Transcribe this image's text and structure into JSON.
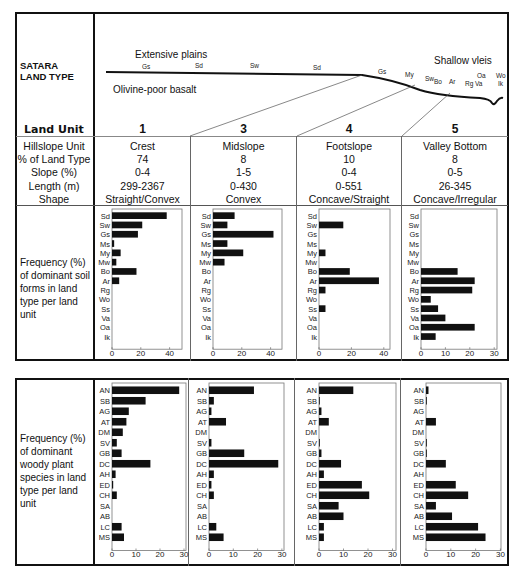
{
  "header": {
    "land_type_label": "SATARA LAND TYPE",
    "profile": {
      "extensive_plains": "Extensive plains",
      "shallow_vleis": "Shallow vleis",
      "geology": "Olivine-poor basalt",
      "soil_tags": [
        "Gs",
        "Sd",
        "Sw",
        "Sd",
        "Gs",
        "My",
        "Sw",
        "Bo",
        "Ar",
        "Rg",
        "Va",
        "Oa",
        "Wo",
        "Ik"
      ]
    }
  },
  "table": {
    "land_unit_label": "Land Unit",
    "units": [
      "1",
      "3",
      "4",
      "5"
    ],
    "rows": [
      {
        "label": "Hillslope Unit",
        "values": [
          "Crest",
          "Midslope",
          "Footslope",
          "Valley Bottom"
        ]
      },
      {
        "label": "% of Land Type",
        "values": [
          "74",
          "8",
          "10",
          "8"
        ]
      },
      {
        "label": "Slope (%)",
        "values": [
          "0-4",
          "1-5",
          "0-4",
          "0-5"
        ]
      },
      {
        "label": "Length (m)",
        "values": [
          "299-2367",
          "0-430",
          "0-551",
          "26-345"
        ]
      },
      {
        "label": "Shape",
        "values": [
          "Straight/Convex",
          "Convex",
          "Concave/Straight",
          "Concave/Irregular"
        ]
      }
    ],
    "soil_section_label": "Frequency (%) of dominant soil forms in land type per land unit",
    "woody_section_label": "Frequency (%) of dominant woody plant species in land type per land unit"
  },
  "chart_data": [
    {
      "type": "bar",
      "orientation": "horizontal",
      "title": "Soil forms - Land unit 1 (Crest)",
      "categories": [
        "Sd",
        "Sw",
        "Gs",
        "Ms",
        "My",
        "Mw",
        "Bo",
        "Ar",
        "Rg",
        "Wo",
        "Ss",
        "Va",
        "Oa",
        "Ik"
      ],
      "values": [
        38,
        21,
        18,
        1.5,
        6,
        3,
        17,
        5,
        0,
        0,
        0,
        0,
        0,
        0
      ],
      "xlim": [
        0,
        50
      ],
      "xticks": [
        0,
        20,
        40
      ]
    },
    {
      "type": "bar",
      "orientation": "horizontal",
      "title": "Soil forms - Land unit 3 (Midslope)",
      "categories": [
        "Sd",
        "Sw",
        "Gs",
        "Ms",
        "My",
        "Mw",
        "Bo",
        "Ar",
        "Rg",
        "Wo",
        "Ss",
        "Va",
        "Oa",
        "Ik"
      ],
      "values": [
        15,
        10,
        42,
        10,
        21,
        8,
        0,
        0,
        0,
        0,
        0,
        0,
        0,
        0
      ],
      "xlim": [
        0,
        50
      ],
      "xticks": [
        0,
        20,
        40
      ]
    },
    {
      "type": "bar",
      "orientation": "horizontal",
      "title": "Soil forms - Land unit 4 (Footslope)",
      "categories": [
        "Sd",
        "Sw",
        "Gs",
        "Ms",
        "My",
        "Mw",
        "Bo",
        "Ar",
        "Rg",
        "Wo",
        "Ss",
        "Va",
        "Oa",
        "Ik"
      ],
      "values": [
        0,
        15,
        0,
        0,
        4,
        0,
        19,
        37,
        4,
        0,
        4,
        0,
        0,
        0
      ],
      "xlim": [
        0,
        45
      ],
      "xticks": [
        0,
        20,
        40
      ]
    },
    {
      "type": "bar",
      "orientation": "horizontal",
      "title": "Soil forms - Land unit 5 (Valley Bottom)",
      "categories": [
        "Sd",
        "Sw",
        "Gs",
        "Ms",
        "My",
        "Mw",
        "Bo",
        "Ar",
        "Rg",
        "Wo",
        "Ss",
        "Va",
        "Oa",
        "Ik"
      ],
      "values": [
        0,
        0,
        0,
        0,
        0,
        0,
        15,
        22,
        21,
        4,
        7,
        10,
        22,
        6
      ],
      "xlim": [
        0,
        31
      ],
      "xticks": [
        0,
        10,
        20,
        30
      ]
    },
    {
      "type": "bar",
      "orientation": "horizontal",
      "title": "Woody species - Land unit 1 (Crest)",
      "categories": [
        "AN",
        "SB",
        "AG",
        "AT",
        "DM",
        "SV",
        "GB",
        "DC",
        "AH",
        "ED",
        "CH",
        "SA",
        "AB",
        "LC",
        "MS"
      ],
      "values": [
        28,
        14,
        7,
        6,
        4.5,
        2,
        4,
        16,
        1.5,
        0.5,
        2,
        0,
        0,
        4,
        5
      ],
      "xlim": [
        0,
        30
      ],
      "xticks": [
        0,
        10,
        20,
        30
      ]
    },
    {
      "type": "bar",
      "orientation": "horizontal",
      "title": "Woody species - Land unit 3 (Midslope)",
      "categories": [
        "AN",
        "SB",
        "AG",
        "AT",
        "DM",
        "SV",
        "GB",
        "DC",
        "AH",
        "ED",
        "CH",
        "SA",
        "AB",
        "LC",
        "MS"
      ],
      "values": [
        18.5,
        2,
        1,
        7,
        0,
        1,
        14.5,
        28.5,
        2,
        1,
        2,
        0,
        0,
        3,
        6
      ],
      "xlim": [
        0,
        30
      ],
      "xticks": [
        0,
        10,
        20,
        30
      ]
    },
    {
      "type": "bar",
      "orientation": "horizontal",
      "title": "Woody species - Land unit 4 (Footslope)",
      "categories": [
        "AN",
        "SB",
        "AG",
        "AT",
        "DM",
        "SV",
        "GB",
        "DC",
        "AH",
        "ED",
        "CH",
        "SA",
        "AB",
        "LC",
        "MS"
      ],
      "values": [
        14,
        0.3,
        1,
        4,
        0,
        0.3,
        1,
        9,
        2,
        17.5,
        20.5,
        8,
        10,
        2,
        2
      ],
      "xlim": [
        0,
        30
      ],
      "xticks": [
        0,
        10,
        20,
        30
      ]
    },
    {
      "type": "bar",
      "orientation": "horizontal",
      "title": "Woody species - Land unit 5 (Valley Bottom)",
      "categories": [
        "AN",
        "SB",
        "AG",
        "AT",
        "DM",
        "SV",
        "GB",
        "DC",
        "AH",
        "ED",
        "CH",
        "SA",
        "AB",
        "LC",
        "MS"
      ],
      "values": [
        1,
        0.3,
        0,
        4,
        0,
        0.3,
        0.3,
        8,
        0,
        12,
        17,
        4,
        10.5,
        21,
        24
      ],
      "xlim": [
        0,
        30
      ],
      "xticks": [
        0,
        10,
        20,
        30
      ]
    }
  ]
}
